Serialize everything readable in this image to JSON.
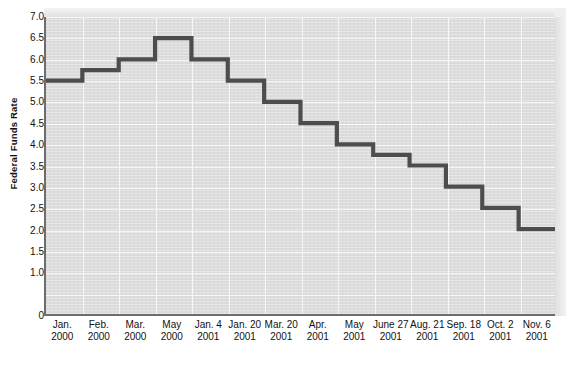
{
  "chart_data": {
    "type": "line",
    "step": "post",
    "title": "",
    "xlabel": "",
    "ylabel": "Federal Funds Rate",
    "ylim": [
      0,
      7.0
    ],
    "grid": true,
    "legend": "none",
    "y_ticks": [
      "0",
      "1.0",
      "1.5",
      "2.0",
      "2.5",
      "3.0",
      "3.5",
      "4.0",
      "4.5",
      "5.0",
      "5.5",
      "6.0",
      "6.5",
      "7.0"
    ],
    "y_tick_values": [
      0,
      1.0,
      1.5,
      2.0,
      2.5,
      3.0,
      3.5,
      4.0,
      4.5,
      5.0,
      5.5,
      6.0,
      6.5,
      7.0
    ],
    "categories": [
      {
        "line1": "Jan.",
        "line2": "2000"
      },
      {
        "line1": "Feb.",
        "line2": "2000"
      },
      {
        "line1": "Mar.",
        "line2": "2000"
      },
      {
        "line1": "May",
        "line2": "2000"
      },
      {
        "line1": "Jan. 4",
        "line2": "2001"
      },
      {
        "line1": "Jan. 20",
        "line2": "2001"
      },
      {
        "line1": "Mar. 20",
        "line2": "2001"
      },
      {
        "line1": "Apr.",
        "line2": "2001"
      },
      {
        "line1": "May",
        "line2": "2001"
      },
      {
        "line1": "June 27",
        "line2": "2001"
      },
      {
        "line1": "Aug. 21",
        "line2": "2001"
      },
      {
        "line1": "Sep. 18",
        "line2": "2001"
      },
      {
        "line1": "Oct. 2",
        "line2": "2001"
      },
      {
        "line1": "Nov. 6",
        "line2": "2001"
      }
    ],
    "values": [
      5.5,
      5.75,
      6.0,
      6.5,
      6.0,
      5.5,
      5.0,
      4.5,
      4.0,
      3.75,
      3.5,
      3.0,
      2.5,
      2.0
    ],
    "final_drop_value": 2.0,
    "series_color": "#4d4d4d",
    "plot_bg_color": "#dcdcdc",
    "gridline_color": "#f7f7f7",
    "axis_color": "#6d6d6d",
    "page_bg_color": "#ffffff"
  }
}
